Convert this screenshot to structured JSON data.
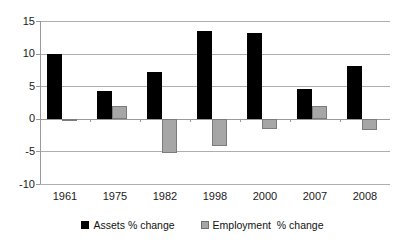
{
  "chart_data": {
    "type": "bar",
    "title": "",
    "subtitle": "",
    "xlabel": "",
    "ylabel": "",
    "categories": [
      "1961",
      "1975",
      "1982",
      "1998",
      "2000",
      "2007",
      "2008"
    ],
    "series": [
      {
        "name": "Assets % change",
        "color": "#000000",
        "values": [
          10.0,
          4.3,
          7.2,
          13.4,
          13.2,
          4.5,
          8.1
        ]
      },
      {
        "name": "Employment  % change",
        "color": "#a6a6a6",
        "values": [
          -0.2,
          2.0,
          -5.2,
          -4.2,
          -1.6,
          1.9,
          -1.7
        ]
      }
    ],
    "ylim": [
      -10,
      15
    ],
    "yticks": [
      15,
      10,
      5,
      0,
      -5,
      -10
    ],
    "ytick_labels": [
      "15",
      "10",
      "5",
      "0",
      "-5",
      "-10"
    ],
    "grid": true,
    "grid_axis": "y",
    "legend_position": "bottom",
    "legend": [
      {
        "label": "Assets % change",
        "swatch": "black-square-swatch"
      },
      {
        "label": "Employment  % change",
        "swatch": "gray-square-swatch"
      }
    ]
  },
  "colors": {
    "assets": "#000000",
    "employment": "#a6a6a6",
    "employment_border": "#7b7b7b",
    "gridline": "#aeaeae",
    "axis": "#9a9a9a",
    "background": "#ffffff",
    "text": "#1a1a1a"
  }
}
